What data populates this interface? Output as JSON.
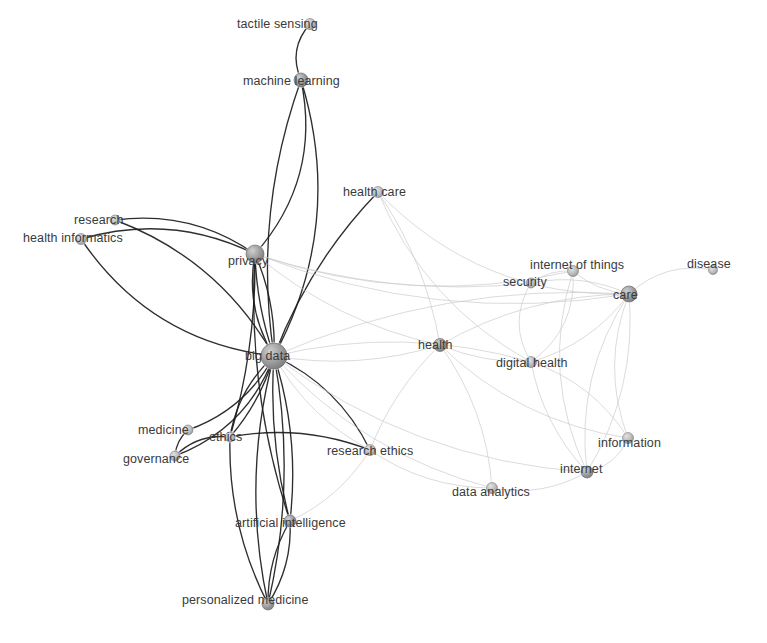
{
  "figure": {
    "type": "network-graph",
    "title": "",
    "background_color": "#ffffff",
    "node_fill_color": "#9a9a9a",
    "node_stroke_color": "#6b6b6b",
    "label_color": "#3a3a3a",
    "edge_color_strong": "#1c1c1c",
    "edge_color_weak": "#c9c9c9"
  },
  "chart_data": {
    "type": "network",
    "node_count": 23,
    "edge_count": 62,
    "nodes": [
      {
        "id": "tactile_sensing",
        "label": "tactile sensing",
        "x": 310,
        "y": 24,
        "r": 5.5,
        "label_x": 237,
        "label_y": 18,
        "weight": 1
      },
      {
        "id": "machine_learning",
        "label": "machine learning",
        "x": 301,
        "y": 80,
        "r": 7.0,
        "label_x": 243,
        "label_y": 75,
        "weight": 3
      },
      {
        "id": "health_care",
        "label": "health care",
        "x": 378,
        "y": 192,
        "r": 5.5,
        "label_x": 343,
        "label_y": 186,
        "weight": 2
      },
      {
        "id": "research",
        "label": "research",
        "x": 115,
        "y": 220,
        "r": 5.0,
        "label_x": 74,
        "label_y": 214,
        "weight": 2
      },
      {
        "id": "health_informatics",
        "label": "health informatics",
        "x": 81,
        "y": 239,
        "r": 5.5,
        "label_x": 23,
        "label_y": 232,
        "weight": 2
      },
      {
        "id": "privacy",
        "label": "privacy",
        "x": 255,
        "y": 254,
        "r": 9.0,
        "label_x": 228,
        "label_y": 255,
        "weight": 9
      },
      {
        "id": "internet_of_things",
        "label": "internet of things",
        "x": 573,
        "y": 271,
        "r": 5.5,
        "label_x": 530,
        "label_y": 259,
        "weight": 4
      },
      {
        "id": "disease",
        "label": "disease",
        "x": 713,
        "y": 270,
        "r": 4.5,
        "label_x": 687,
        "label_y": 258,
        "weight": 1
      },
      {
        "id": "security",
        "label": "security",
        "x": 531,
        "y": 283,
        "r": 5.0,
        "label_x": 503,
        "label_y": 276,
        "weight": 3
      },
      {
        "id": "care",
        "label": "care",
        "x": 629,
        "y": 294,
        "r": 8.0,
        "label_x": 613,
        "label_y": 289,
        "weight": 8
      },
      {
        "id": "health",
        "label": "health",
        "x": 440,
        "y": 345,
        "r": 6.5,
        "label_x": 418,
        "label_y": 339,
        "weight": 6
      },
      {
        "id": "big_data",
        "label": "big data",
        "x": 274,
        "y": 356,
        "r": 13.0,
        "label_x": 245,
        "label_y": 350,
        "weight": 20
      },
      {
        "id": "digital_health",
        "label": "digital health",
        "x": 531,
        "y": 362,
        "r": 5.5,
        "label_x": 496,
        "label_y": 357,
        "weight": 5
      },
      {
        "id": "medicine",
        "label": "medicine",
        "x": 188,
        "y": 430,
        "r": 5.0,
        "label_x": 138,
        "label_y": 424,
        "weight": 2
      },
      {
        "id": "ethics",
        "label": "ethics",
        "x": 230,
        "y": 437,
        "r": 5.0,
        "label_x": 209,
        "label_y": 431,
        "weight": 4
      },
      {
        "id": "information",
        "label": "information",
        "x": 628,
        "y": 438,
        "r": 5.5,
        "label_x": 598,
        "label_y": 437,
        "weight": 4
      },
      {
        "id": "research_ethics",
        "label": "research ethics",
        "x": 370,
        "y": 450,
        "r": 5.5,
        "label_x": 327,
        "label_y": 445,
        "weight": 5
      },
      {
        "id": "governance",
        "label": "governance",
        "x": 175,
        "y": 456,
        "r": 5.0,
        "label_x": 123,
        "label_y": 453,
        "weight": 3
      },
      {
        "id": "internet",
        "label": "internet",
        "x": 587,
        "y": 472,
        "r": 6.0,
        "label_x": 560,
        "label_y": 463,
        "weight": 5
      },
      {
        "id": "data_analytics",
        "label": "data analytics",
        "x": 492,
        "y": 488,
        "r": 5.5,
        "label_x": 452,
        "label_y": 486,
        "weight": 4
      },
      {
        "id": "artificial_intelligence",
        "label": "artificial intelligence",
        "x": 290,
        "y": 521,
        "r": 6.0,
        "label_x": 235,
        "label_y": 517,
        "weight": 5
      },
      {
        "id": "personalized_medicine",
        "label": "personalized medicine",
        "x": 268,
        "y": 604,
        "r": 6.0,
        "label_x": 182,
        "label_y": 594,
        "weight": 4
      }
    ],
    "edges": [
      {
        "source": "tactile_sensing",
        "target": "machine_learning",
        "strength": "strong",
        "curve": 18
      },
      {
        "source": "machine_learning",
        "target": "privacy",
        "strength": "strong",
        "curve": -45
      },
      {
        "source": "machine_learning",
        "target": "big_data",
        "strength": "strong",
        "curve": 35
      },
      {
        "source": "machine_learning",
        "target": "big_data",
        "strength": "strong",
        "curve": -58
      },
      {
        "source": "health_care",
        "target": "big_data",
        "strength": "strong",
        "curve": 20
      },
      {
        "source": "health_care",
        "target": "health",
        "strength": "weak",
        "curve": -18
      },
      {
        "source": "health_care",
        "target": "care",
        "strength": "weak",
        "curve": 60
      },
      {
        "source": "health_care",
        "target": "digital_health",
        "strength": "weak",
        "curve": 40
      },
      {
        "source": "research",
        "target": "privacy",
        "strength": "strong",
        "curve": -28
      },
      {
        "source": "research",
        "target": "big_data",
        "strength": "strong",
        "curve": -38
      },
      {
        "source": "health_informatics",
        "target": "privacy",
        "strength": "strong",
        "curve": -34
      },
      {
        "source": "health_informatics",
        "target": "big_data",
        "strength": "strong",
        "curve": 52
      },
      {
        "source": "privacy",
        "target": "big_data",
        "strength": "strong",
        "curve": 8
      },
      {
        "source": "privacy",
        "target": "big_data",
        "strength": "strong",
        "curve": -12
      },
      {
        "source": "privacy",
        "target": "big_data",
        "strength": "strong",
        "curve": 20
      },
      {
        "source": "privacy",
        "target": "security",
        "strength": "weak",
        "curve": 30
      },
      {
        "source": "privacy",
        "target": "care",
        "strength": "weak",
        "curve": 52
      },
      {
        "source": "privacy",
        "target": "internet_of_things",
        "strength": "weak",
        "curve": 46
      },
      {
        "source": "privacy",
        "target": "health",
        "strength": "weak",
        "curve": 26
      },
      {
        "source": "privacy",
        "target": "ethics",
        "strength": "strong",
        "curve": -14
      },
      {
        "source": "privacy",
        "target": "artificial_intelligence",
        "strength": "strong",
        "curve": 26
      },
      {
        "source": "internet_of_things",
        "target": "care",
        "strength": "weak",
        "curve": 10
      },
      {
        "source": "internet_of_things",
        "target": "security",
        "strength": "weak",
        "curve": 8
      },
      {
        "source": "internet_of_things",
        "target": "internet",
        "strength": "weak",
        "curve": 40
      },
      {
        "source": "internet_of_things",
        "target": "digital_health",
        "strength": "weak",
        "curve": -28
      },
      {
        "source": "disease",
        "target": "care",
        "strength": "weak",
        "curve": 22
      },
      {
        "source": "security",
        "target": "care",
        "strength": "weak",
        "curve": -16
      },
      {
        "source": "security",
        "target": "digital_health",
        "strength": "weak",
        "curve": 24
      },
      {
        "source": "care",
        "target": "health",
        "strength": "weak",
        "curve": 26
      },
      {
        "source": "care",
        "target": "digital_health",
        "strength": "weak",
        "curve": -20
      },
      {
        "source": "care",
        "target": "information",
        "strength": "weak",
        "curve": 28
      },
      {
        "source": "care",
        "target": "internet",
        "strength": "weak",
        "curve": 34
      },
      {
        "source": "care",
        "target": "internet",
        "strength": "weak",
        "curve": -30
      },
      {
        "source": "care",
        "target": "big_data",
        "strength": "weak",
        "curve": 44
      },
      {
        "source": "health",
        "target": "digital_health",
        "strength": "weak",
        "curve": 10
      },
      {
        "source": "health",
        "target": "big_data",
        "strength": "weak",
        "curve": -20
      },
      {
        "source": "health",
        "target": "research_ethics",
        "strength": "weak",
        "curve": 14
      },
      {
        "source": "health",
        "target": "data_analytics",
        "strength": "weak",
        "curve": -22
      },
      {
        "source": "health",
        "target": "information",
        "strength": "weak",
        "curve": 34
      },
      {
        "source": "big_data",
        "target": "medicine",
        "strength": "strong",
        "curve": -22
      },
      {
        "source": "big_data",
        "target": "ethics",
        "strength": "strong",
        "curve": 16
      },
      {
        "source": "big_data",
        "target": "ethics",
        "strength": "strong",
        "curve": -10
      },
      {
        "source": "big_data",
        "target": "governance",
        "strength": "strong",
        "curve": -32
      },
      {
        "source": "big_data",
        "target": "research_ethics",
        "strength": "weak",
        "curve": 20
      },
      {
        "source": "big_data",
        "target": "research_ethics",
        "strength": "strong",
        "curve": -24
      },
      {
        "source": "big_data",
        "target": "artificial_intelligence",
        "strength": "strong",
        "curve": 14
      },
      {
        "source": "big_data",
        "target": "artificial_intelligence",
        "strength": "strong",
        "curve": -18
      },
      {
        "source": "big_data",
        "target": "personalized_medicine",
        "strength": "strong",
        "curve": 30
      },
      {
        "source": "big_data",
        "target": "personalized_medicine",
        "strength": "strong",
        "curve": -26
      },
      {
        "source": "big_data",
        "target": "data_analytics",
        "strength": "weak",
        "curve": 38
      },
      {
        "source": "big_data",
        "target": "internet",
        "strength": "weak",
        "curve": 50
      },
      {
        "source": "big_data",
        "target": "digital_health",
        "strength": "weak",
        "curve": -34
      },
      {
        "source": "digital_health",
        "target": "internet",
        "strength": "weak",
        "curve": 18
      },
      {
        "source": "digital_health",
        "target": "information",
        "strength": "weak",
        "curve": -22
      },
      {
        "source": "medicine",
        "target": "governance",
        "strength": "strong",
        "curve": 6
      },
      {
        "source": "ethics",
        "target": "governance",
        "strength": "strong",
        "curve": 14
      },
      {
        "source": "ethics",
        "target": "research_ethics",
        "strength": "strong",
        "curve": -20
      },
      {
        "source": "ethics",
        "target": "personalized_medicine",
        "strength": "strong",
        "curve": 22
      },
      {
        "source": "information",
        "target": "internet",
        "strength": "weak",
        "curve": -14
      },
      {
        "source": "research_ethics",
        "target": "data_analytics",
        "strength": "weak",
        "curve": 20
      },
      {
        "source": "research_ethics",
        "target": "artificial_intelligence",
        "strength": "weak",
        "curve": -16
      },
      {
        "source": "data_analytics",
        "target": "internet",
        "strength": "weak",
        "curve": 18
      },
      {
        "source": "artificial_intelligence",
        "target": "personalized_medicine",
        "strength": "strong",
        "curve": 12
      },
      {
        "source": "artificial_intelligence",
        "target": "personalized_medicine",
        "strength": "strong",
        "curve": -14
      }
    ]
  }
}
